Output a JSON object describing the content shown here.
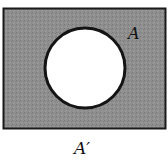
{
  "diagram": {
    "type": "venn-complement",
    "universe": {
      "fill": "#8c8c8c",
      "border": "#1a1a1a"
    },
    "set": {
      "name": "A",
      "fill": "#ffffff",
      "border": "#141414"
    },
    "labels": {
      "set_label": "A",
      "complement_label": "A′"
    },
    "caption_fragment": "(b)"
  }
}
